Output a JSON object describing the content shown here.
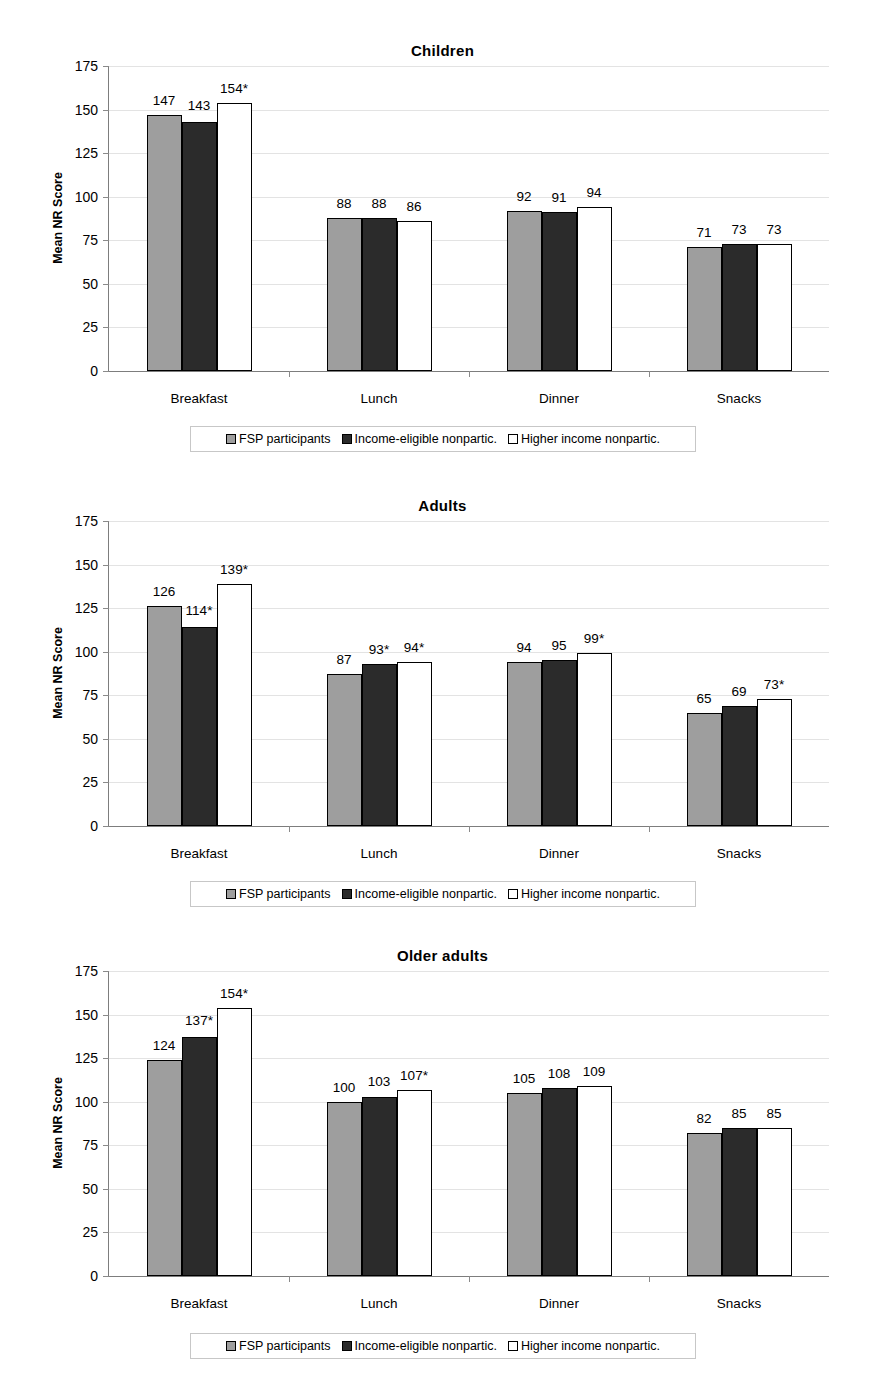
{
  "figure": {
    "background": "#ffffff",
    "series_colors": [
      "#9e9e9e",
      "#2b2b2b",
      "#ffffff"
    ],
    "axis_color": "#7d7d7d",
    "grid_color": "#e3e3e3"
  },
  "legend": {
    "items": [
      {
        "label": "FSP participants",
        "swatch": "light-gray-swatch-icon"
      },
      {
        "label": "Income-eligible nonpartic.",
        "swatch": "dark-gray-swatch-icon"
      },
      {
        "label": "Higher income nonpartic.",
        "swatch": "white-swatch-icon"
      }
    ]
  },
  "axis": {
    "ylabel": "Mean NR Score",
    "yticks": [
      "175",
      "150",
      "125",
      "100",
      "75",
      "50",
      "25",
      "0"
    ],
    "ytick_values": [
      175,
      150,
      125,
      100,
      75,
      50,
      25,
      0
    ],
    "ymin": 0,
    "ymax": 175,
    "categories": [
      "Breakfast",
      "Lunch",
      "Dinner",
      "Snacks"
    ]
  },
  "chart_data": [
    {
      "type": "bar",
      "title": "Children",
      "xlabel": "",
      "ylabel": "Mean NR Score",
      "ylim": [
        0,
        175
      ],
      "ytick_step": 25,
      "grid": true,
      "legend_position": "bottom",
      "categories": [
        "Breakfast",
        "Lunch",
        "Dinner",
        "Snacks"
      ],
      "series": [
        {
          "name": "FSP participants",
          "values": [
            147,
            88,
            92,
            71
          ],
          "labels": [
            "147",
            "88",
            "92",
            "71"
          ]
        },
        {
          "name": "Income-eligible nonpartic.",
          "values": [
            143,
            88,
            91,
            73
          ],
          "labels": [
            "143",
            "88",
            "91",
            "73"
          ]
        },
        {
          "name": "Higher income nonpartic.",
          "values": [
            154,
            86,
            94,
            73
          ],
          "labels": [
            "154*",
            "86",
            "94",
            "73"
          ]
        }
      ]
    },
    {
      "type": "bar",
      "title": "Adults",
      "xlabel": "",
      "ylabel": "Mean NR Score",
      "ylim": [
        0,
        175
      ],
      "ytick_step": 25,
      "grid": true,
      "legend_position": "bottom",
      "categories": [
        "Breakfast",
        "Lunch",
        "Dinner",
        "Snacks"
      ],
      "series": [
        {
          "name": "FSP participants",
          "values": [
            126,
            87,
            94,
            65
          ],
          "labels": [
            "126",
            "87",
            "94",
            "65"
          ]
        },
        {
          "name": "Income-eligible nonpartic.",
          "values": [
            114,
            93,
            95,
            69
          ],
          "labels": [
            "114*",
            "93*",
            "95",
            "69"
          ]
        },
        {
          "name": "Higher income nonpartic.",
          "values": [
            139,
            94,
            99,
            73
          ],
          "labels": [
            "139*",
            "94*",
            "99*",
            "73*"
          ]
        }
      ]
    },
    {
      "type": "bar",
      "title": "Older adults",
      "xlabel": "",
      "ylabel": "Mean NR Score",
      "ylim": [
        0,
        175
      ],
      "ytick_step": 25,
      "grid": true,
      "legend_position": "bottom",
      "categories": [
        "Breakfast",
        "Lunch",
        "Dinner",
        "Snacks"
      ],
      "series": [
        {
          "name": "FSP participants",
          "values": [
            124,
            100,
            105,
            82
          ],
          "labels": [
            "124",
            "100",
            "105",
            "82"
          ]
        },
        {
          "name": "Income-eligible nonpartic.",
          "values": [
            137,
            103,
            108,
            85
          ],
          "labels": [
            "137*",
            "103",
            "108",
            "85"
          ]
        },
        {
          "name": "Higher income nonpartic.",
          "values": [
            154,
            107,
            109,
            85
          ],
          "labels": [
            "154*",
            "107*",
            "109",
            "85"
          ]
        }
      ]
    }
  ]
}
